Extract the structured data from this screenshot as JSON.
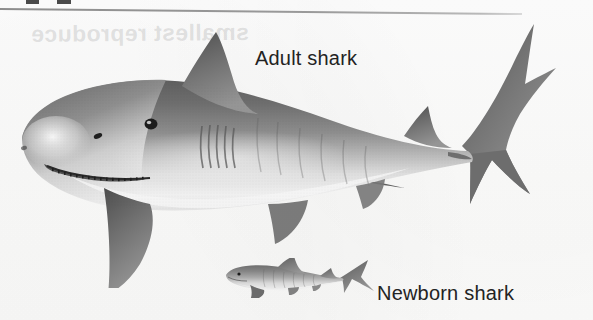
{
  "figure": {
    "background_color": "#fdfdfd",
    "width": 593,
    "height": 320
  },
  "rule": {
    "name": "top-horizontal-rule",
    "color": "#8d8d8d"
  },
  "bleed_through": {
    "text": "smallest reproduce",
    "color": "#787878"
  },
  "labels": {
    "adult": "Adult shark",
    "newborn": "Newborn shark",
    "color": "#232323"
  },
  "illustrations": {
    "adult": {
      "name": "adult-shark",
      "caption": "Adult shark",
      "body_dark": "#6b6b6b",
      "body_mid": "#8f8f8f",
      "belly_light": "#f2f2f2",
      "outline": "#55555",
      "parts": [
        "snout",
        "eye",
        "nostril",
        "mouth-with-teeth",
        "gill-slits",
        "first-dorsal-fin",
        "second-dorsal-fin",
        "pectoral-fin-near",
        "pectoral-fin-far",
        "pelvic-fin",
        "anal-fin",
        "caudal-fin"
      ]
    },
    "newborn": {
      "name": "newborn-shark",
      "caption": "Newborn shark",
      "body_dark": "#7a7a7a",
      "body_mid": "#9d9d9d",
      "belly_light": "#e8e8e8",
      "parts": [
        "snout",
        "eye",
        "first-dorsal-fin",
        "second-dorsal-fin",
        "pectoral-fin",
        "pelvic-fin",
        "anal-fin",
        "caudal-fin"
      ]
    }
  }
}
